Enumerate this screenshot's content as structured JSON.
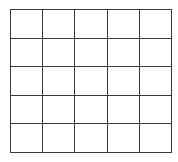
{
  "grid": {
    "rows": 5,
    "columns": 5,
    "line_color": "#3a3a3a",
    "cell_color": "#ffffff",
    "cells": [
      [
        "",
        "",
        "",
        "",
        ""
      ],
      [
        "",
        "",
        "",
        "",
        ""
      ],
      [
        "",
        "",
        "",
        "",
        ""
      ],
      [
        "",
        "",
        "",
        "",
        ""
      ],
      [
        "",
        "",
        "",
        "",
        ""
      ]
    ]
  }
}
